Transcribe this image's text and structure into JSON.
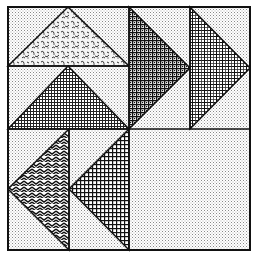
{
  "image": {
    "title": "Flying Geese quilt block",
    "description": "Black-and-white line illustration of a pieced quilt block made of eight flying-geese units arranged as a pinwheel in a 2x2 layout",
    "background_fabric": "fine-dot-texture",
    "colors": {
      "ink": "#111111",
      "paper": "#ffffff",
      "background_dot": "#9a9a9a"
    }
  },
  "blocks": [
    {
      "position": "top-left",
      "direction": "up",
      "geese": [
        {
          "fabric": "floral-leaf-print"
        },
        {
          "fabric": "fine-grid-check"
        }
      ]
    },
    {
      "position": "top-right",
      "direction": "right",
      "geese": [
        {
          "fabric": "bold-check-dots"
        },
        {
          "fabric": "plaid-crosshatch"
        }
      ]
    },
    {
      "position": "bottom-left",
      "direction": "left",
      "geese": [
        {
          "fabric": "chevron-herringbone"
        },
        {
          "fabric": "gingham-check"
        }
      ]
    },
    {
      "position": "bottom-right",
      "direction": "down",
      "geese": [
        {
          "fabric": "dot-grid"
        },
        {
          "fabric": "speckled-print"
        }
      ]
    }
  ]
}
